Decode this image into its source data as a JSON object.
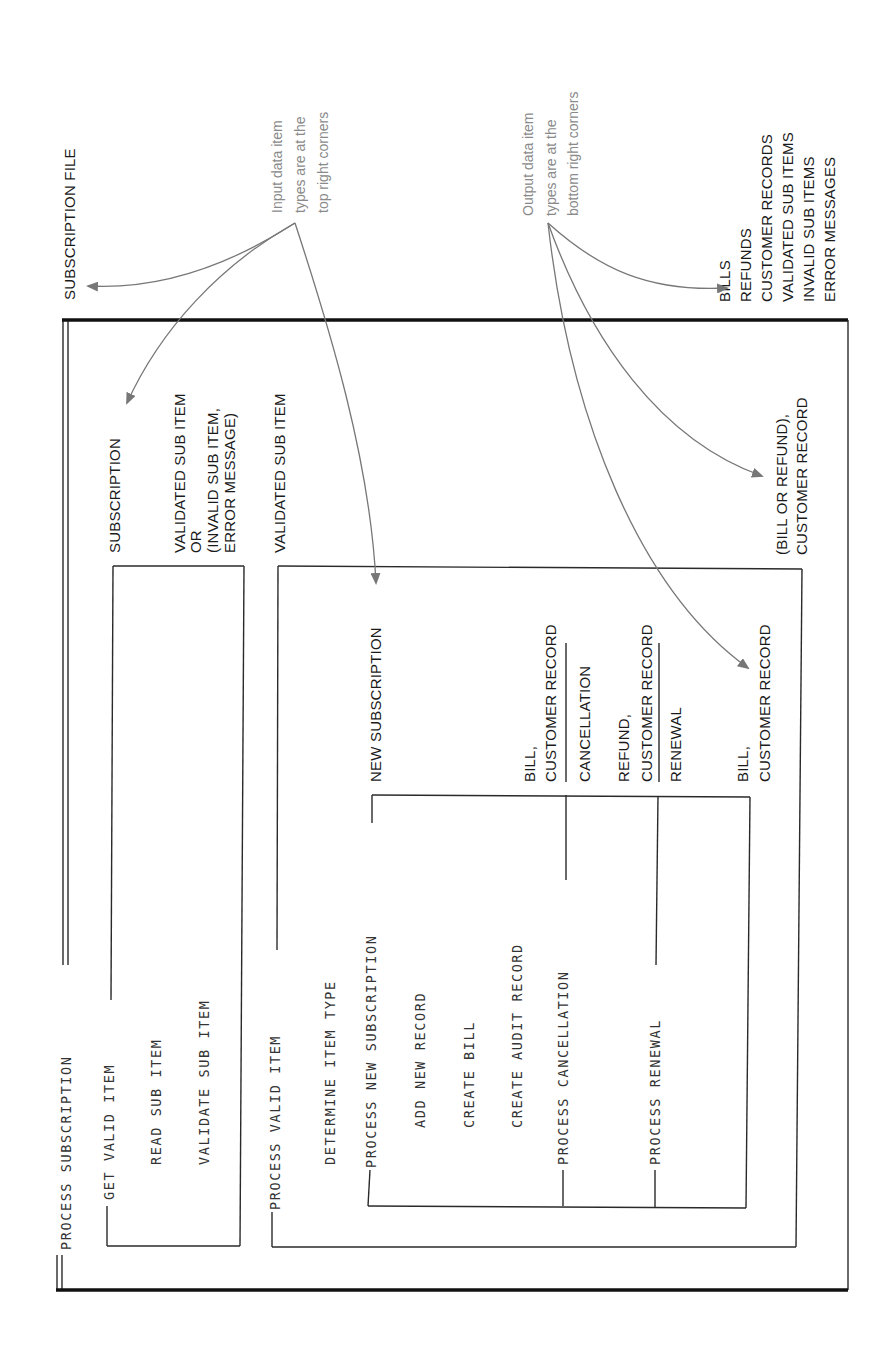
{
  "annotations": {
    "input_note": [
      "Input data item",
      "types are at the",
      "top right corners"
    ],
    "output_note": [
      "Output data item",
      "types are at the",
      "bottom right corners"
    ]
  },
  "file_inputs": {
    "subscription_file": "SUBSCRIPTION FILE"
  },
  "file_outputs": [
    "BILLS",
    "REFUNDS",
    "CUSTOMER RECORDS",
    "VALIDATED SUB ITEMS",
    "INVALID SUB ITEMS",
    "ERROR MESSAGES"
  ],
  "process_subscription": {
    "label": "PROCESS SUBSCRIPTION",
    "output": [
      "(BILL OR REFUND),",
      "CUSTOMER RECORD"
    ],
    "get_valid_item": {
      "label": "GET VALID ITEM",
      "input": "SUBSCRIPTION",
      "output": [
        "VALIDATED SUB ITEM",
        "OR",
        "(INVALID SUB ITEM,",
        "ERROR MESSAGE)"
      ],
      "steps": [
        "READ SUB ITEM",
        "VALIDATE SUB ITEM"
      ]
    },
    "process_valid_item": {
      "label": "PROCESS VALID ITEM",
      "input": "VALIDATED SUB ITEM",
      "steps": [
        "DETERMINE ITEM TYPE"
      ],
      "branches": [
        {
          "label": "PROCESS NEW SUBSCRIPTION",
          "input": "NEW SUBSCRIPTION",
          "output": [
            "BILL,",
            "CUSTOMER RECORD"
          ],
          "steps": [
            "ADD NEW RECORD",
            "CREATE BILL",
            "CREATE AUDIT RECORD"
          ]
        },
        {
          "label": "PROCESS CANCELLATION",
          "input": "CANCELLATION",
          "output": [
            "REFUND,",
            "CUSTOMER RECORD"
          ]
        },
        {
          "label": "PROCESS RENEWAL",
          "input": "RENEWAL",
          "output": [
            "BILL,",
            "CUSTOMER RECORD"
          ]
        }
      ]
    }
  }
}
